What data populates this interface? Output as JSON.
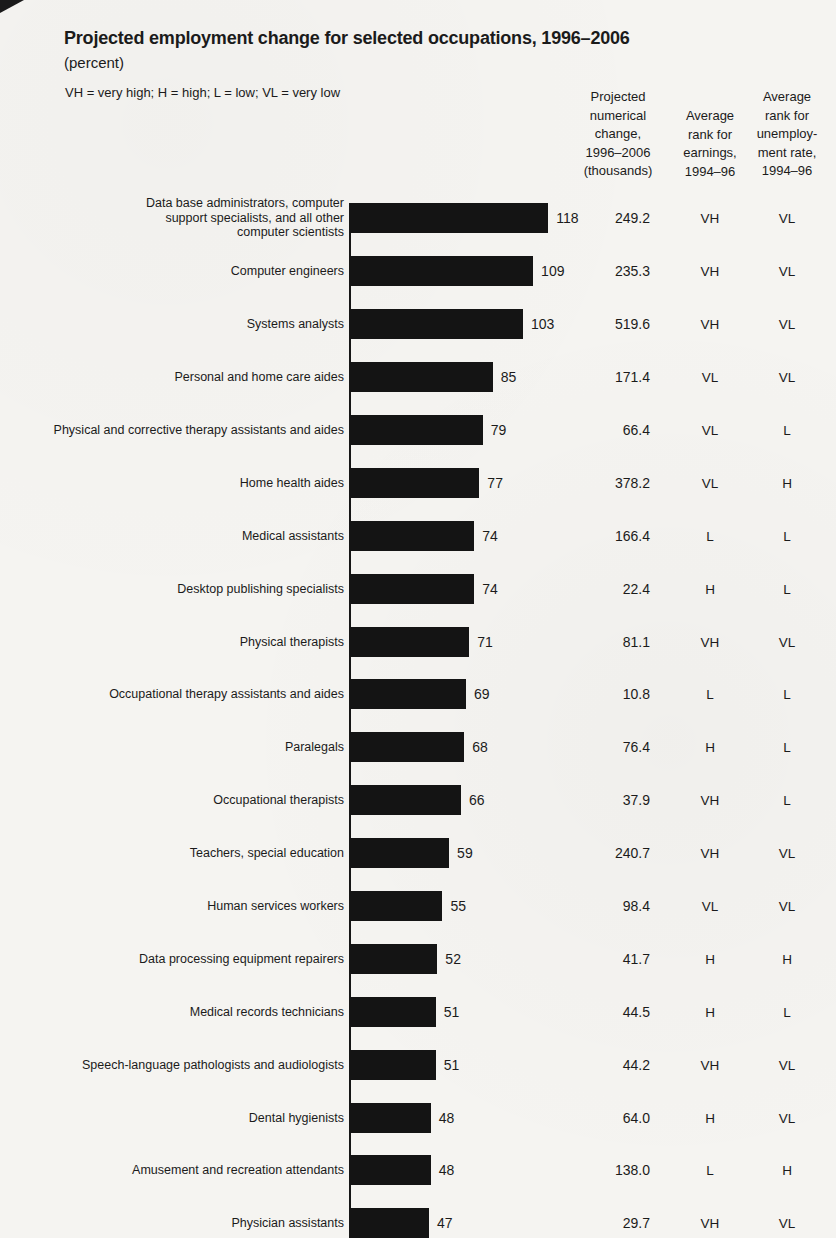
{
  "chart_data": {
    "type": "bar",
    "orientation": "horizontal",
    "title": "Projected employment change for selected occupations, 1996–2006",
    "unit_label": "(percent)",
    "rank_key": "VH = very high; H = high; L = low; VL = very low",
    "xlim": [
      0,
      120
    ],
    "bar_color": "#141414",
    "grid": false,
    "value_columns": {
      "numerical_change": "Projected\nnumerical\nchange,\n1996–2006\n(thousands)",
      "earnings_rank": "Average\nrank for\nearnings,\n1994–96",
      "unemployment_rank": "Average\nrank for\nunemploy-\nment rate,\n1994–96"
    },
    "rows": [
      {
        "occupation": "Data base administrators, computer\nsupport specialists, and all other\ncomputer scientists",
        "percent_change": 118,
        "numerical_change_thousands": "249.2",
        "earnings_rank": "VH",
        "unemployment_rank": "VL"
      },
      {
        "occupation": "Computer engineers",
        "percent_change": 109,
        "numerical_change_thousands": "235.3",
        "earnings_rank": "VH",
        "unemployment_rank": "VL"
      },
      {
        "occupation": "Systems analysts",
        "percent_change": 103,
        "numerical_change_thousands": "519.6",
        "earnings_rank": "VH",
        "unemployment_rank": "VL"
      },
      {
        "occupation": "Personal and home care aides",
        "percent_change": 85,
        "numerical_change_thousands": "171.4",
        "earnings_rank": "VL",
        "unemployment_rank": "VL"
      },
      {
        "occupation": "Physical and corrective therapy assistants and aides",
        "percent_change": 79,
        "numerical_change_thousands": "66.4",
        "earnings_rank": "VL",
        "unemployment_rank": "L"
      },
      {
        "occupation": "Home health aides",
        "percent_change": 77,
        "numerical_change_thousands": "378.2",
        "earnings_rank": "VL",
        "unemployment_rank": "H"
      },
      {
        "occupation": "Medical assistants",
        "percent_change": 74,
        "numerical_change_thousands": "166.4",
        "earnings_rank": "L",
        "unemployment_rank": "L"
      },
      {
        "occupation": "Desktop publishing specialists",
        "percent_change": 74,
        "numerical_change_thousands": "22.4",
        "earnings_rank": "H",
        "unemployment_rank": "L"
      },
      {
        "occupation": "Physical therapists",
        "percent_change": 71,
        "numerical_change_thousands": "81.1",
        "earnings_rank": "VH",
        "unemployment_rank": "VL"
      },
      {
        "occupation": "Occupational therapy assistants and aides",
        "percent_change": 69,
        "numerical_change_thousands": "10.8",
        "earnings_rank": "L",
        "unemployment_rank": "L"
      },
      {
        "occupation": "Paralegals",
        "percent_change": 68,
        "numerical_change_thousands": "76.4",
        "earnings_rank": "H",
        "unemployment_rank": "L"
      },
      {
        "occupation": "Occupational therapists",
        "percent_change": 66,
        "numerical_change_thousands": "37.9",
        "earnings_rank": "VH",
        "unemployment_rank": "L"
      },
      {
        "occupation": "Teachers, special education",
        "percent_change": 59,
        "numerical_change_thousands": "240.7",
        "earnings_rank": "VH",
        "unemployment_rank": "VL"
      },
      {
        "occupation": "Human services workers",
        "percent_change": 55,
        "numerical_change_thousands": "98.4",
        "earnings_rank": "VL",
        "unemployment_rank": "VL"
      },
      {
        "occupation": "Data processing equipment repairers",
        "percent_change": 52,
        "numerical_change_thousands": "41.7",
        "earnings_rank": "H",
        "unemployment_rank": "H"
      },
      {
        "occupation": "Medical records technicians",
        "percent_change": 51,
        "numerical_change_thousands": "44.5",
        "earnings_rank": "H",
        "unemployment_rank": "L"
      },
      {
        "occupation": "Speech-language pathologists and audiologists",
        "percent_change": 51,
        "numerical_change_thousands": "44.2",
        "earnings_rank": "VH",
        "unemployment_rank": "VL"
      },
      {
        "occupation": "Dental hygienists",
        "percent_change": 48,
        "numerical_change_thousands": "64.0",
        "earnings_rank": "H",
        "unemployment_rank": "VL"
      },
      {
        "occupation": "Amusement and recreation attendants",
        "percent_change": 48,
        "numerical_change_thousands": "138.0",
        "earnings_rank": "L",
        "unemployment_rank": "H"
      },
      {
        "occupation": "Physician assistants",
        "percent_change": 47,
        "numerical_change_thousands": "29.7",
        "earnings_rank": "VH",
        "unemployment_rank": "VL"
      }
    ]
  }
}
